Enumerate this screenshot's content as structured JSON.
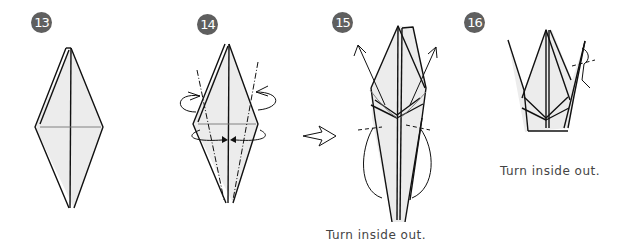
{
  "steps": [
    {
      "number": "13",
      "caption": ""
    },
    {
      "number": "14",
      "caption": ""
    },
    {
      "number": "15",
      "caption": "Turn inside out."
    },
    {
      "number": "16",
      "caption": "Turn inside out."
    }
  ],
  "colors": {
    "badge": "#5f5f5f",
    "paper_fill": "#ececec",
    "line": "#111111",
    "caption_text": "#444444"
  },
  "icons": {
    "next_step_arrow": "hollow-right-arrow"
  }
}
